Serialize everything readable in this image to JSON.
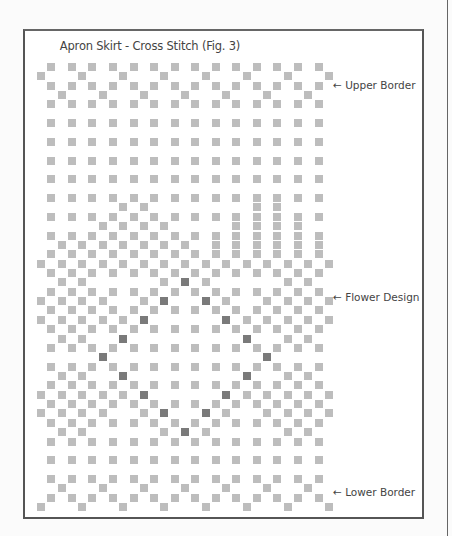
{
  "title": "Apron Skirt - Cross Stitch (Fig. 3)",
  "labels": [
    {
      "text": "← Upper Border",
      "top": 79
    },
    {
      "text": "← Flower Design",
      "top": 291
    },
    {
      "text": "← Lower Border",
      "top": 486
    }
  ],
  "colors": {
    "light_stitch": "#bdbdbd",
    "dark_stitch": "#7a7a7a",
    "frame": "#555555"
  },
  "grid": {
    "cols": 29,
    "col_pitch": 10.28,
    "row_pitch": 8.85,
    "legend": {
      ".": "empty",
      "o": "light stitch",
      "x": "dark stitch"
    },
    "rows": [
      ".o.o.o.o.o.o.o.o.o.o.o.o.o.o.",
      "o...o...o...o...o...o...o...o",
      ".o.o.o.o.o.o.o.o.o.o.o.o.o.o.",
      "..o...o...o...o...o...o...o..",
      ".o.o.o.o.o.o.o.o.o.o.o.o.o.o.",
      ".............................",
      ".o.o.o.o.o.o.o.o.o.o.o.o.o.o.",
      ".............................",
      ".o.o.o.o.o.o.o.o.o.o.o.o.o.o.",
      ".............................",
      ".o.o.o.o.o.o.o.o.o.o.o.o.o.o.",
      ".............................",
      ".o.o.o.o.o.o.o.o.o.o.o.o.o.o.",
      ".............................",
      ".o.o.o.o.o.o.o.o.o.o.o.o.o.o.",
      "........o.o..........o.o.....",
      ".o.o.o.o.o.o.o.o.o.o.o.o.o.o.",
      "......o.o.o.o......o.o.o.o...",
      ".o.o.o.o.o.o.o.o.o.o.o.o.o.o.",
      "..o.o.o.o.o.o.o..o.o.o.o.o.o.",
      ".o.o.o.o.o.o.o.o.o.o.o.o.o.o.",
      "o.o.o.o.o.o.o.o.o.o.o.o.o.o.o",
      ".o.o.o.o.o.o.o.o.o.o.o.o.o.o.",
      "..o.o.......o.x.o.......o.o..",
      ".o.o.o.o.o.o.o.o.o.o.o.o.o.o.",
      "o.o.o.o...o.x...x.o...o.o.o.o",
      ".o.o.o.o.o.o.o.o.o.o.o.o.o.o.",
      "o.o.o.o.o.x.......x.o.o.o.o.o",
      ".o.o.o.o.o.o.o.o.o.o.o.o.o.o.",
      "..o.o...x...........x...o.o..",
      ".o.o.o.o.o.o.o.o.o.o.o.o.o.o.",
      "......x...............x......",
      ".o.o.o.o.o.o.o.o.o.o.o.o.o.o.",
      "..o.o...x...........x...o.o..",
      ".o.o.o.o.o.o.o.o.o.o.o.o.o.o.",
      "o.o.o.o.o.x.......x.o.o.o.o.o",
      ".o.o.o.o.o.o.o.o.o.o.o.o.o.o.",
      "o.o.o.o...o.x...x.o...o.o.o.o",
      ".o.o.o.o.o.o.o.o.o.o.o.o.o.o.",
      "..o.o.......o.x.o.......o.o..",
      ".o.o.o.o.o.o.o.o.o.o.o.o.o.o.",
      ".............................",
      ".o.o.o.o.o.o.o.o.o.o.o.o.o.o.",
      ".............................",
      ".o.o.o.o.o.o.o.o.o.o.o.o.o.o.",
      "..o...o...o...o...o...o...o..",
      ".o.o.o.o.o.o.o.o.o.o.o.o.o.o.",
      "o...o...o...o...o...o...o...o"
    ]
  }
}
